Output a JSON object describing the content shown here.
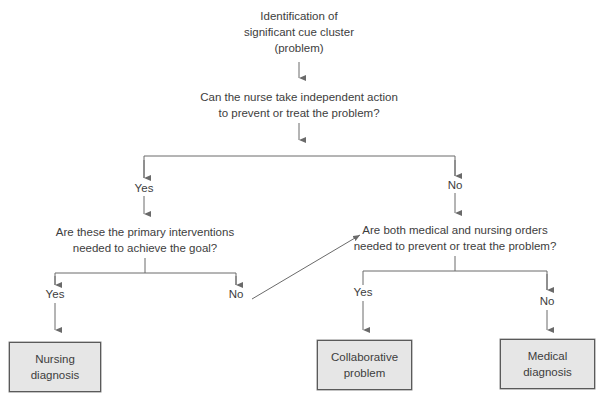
{
  "diagram": {
    "start": {
      "line1": "Identification of",
      "line2": "significant cue cluster",
      "line3": "(problem)"
    },
    "q1": {
      "line1": "Can the nurse take independent action",
      "line2": "to prevent or treat the problem?"
    },
    "q1_yes": "Yes",
    "q1_no": "No",
    "q2": {
      "line1": "Are these the primary interventions",
      "line2": "needed to achieve the goal?"
    },
    "q2_yes": "Yes",
    "q2_no": "No",
    "q3": {
      "line1": "Are both medical and nursing orders",
      "line2": "needed to prevent or treat the problem?"
    },
    "q3_yes": "Yes",
    "q3_no": "No",
    "outcomes": {
      "nursing": {
        "line1": "Nursing",
        "line2": "diagnosis"
      },
      "collaborative": {
        "line1": "Collaborative",
        "line2": "problem"
      },
      "medical": {
        "line1": "Medical",
        "line2": "diagnosis"
      }
    },
    "colors": {
      "line": "#6a6a6a",
      "box_fill": "#e6e6e6",
      "box_border": "#5a5a5a",
      "text": "#3d3d3d"
    }
  }
}
